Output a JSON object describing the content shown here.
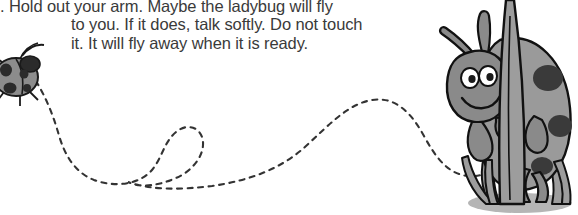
{
  "page": {
    "background_color": "#ffffff",
    "width": 578,
    "height": 215
  },
  "story": {
    "text_color": "#3a3a3a",
    "lines": [
      ". Hold out your arm. Maybe the ladybug will fly",
      "to you. If it does, talk softly. Do not touch",
      "it. It will fly away when it is ready."
    ]
  },
  "illustration": {
    "small_ladybug": {
      "name": "flying ladybug",
      "body_color": "#8c8c8c",
      "outline_color": "#1a1a1a",
      "spot_color": "#2b2b2b"
    },
    "flight_trail": {
      "name": "dashed flight path with loop",
      "color": "#333333",
      "style": "dashed"
    },
    "large_ladybug": {
      "name": "ladybug climbing grass blade",
      "body_color": "#8a8a8a",
      "shell_color": "#9a9a9a",
      "spot_color": "#3a3a3a",
      "outline_color": "#111111",
      "eye_color": "#ffffff",
      "pupil_color": "#1a1a1a"
    },
    "grass": {
      "name": "grass blades",
      "blade_color": "#9d9d9d",
      "outline_color": "#111111"
    },
    "ground_shadow": {
      "name": "ground shadow",
      "color": "#b5b5b5"
    }
  }
}
